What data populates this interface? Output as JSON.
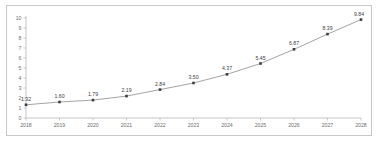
{
  "chart_data": {
    "type": "line",
    "title": "",
    "subtitle": "",
    "xlabel": "",
    "ylabel": "",
    "categories": [
      "2018",
      "2019",
      "2020",
      "2021",
      "2022",
      "2023",
      "2024",
      "2025",
      "2026",
      "2027",
      "2028"
    ],
    "values": [
      1.32,
      1.6,
      1.79,
      2.19,
      2.84,
      3.5,
      4.37,
      5.45,
      6.87,
      8.39,
      9.84
    ],
    "point_labels": [
      "1.32",
      "1.60",
      "1.79",
      "2.19",
      "2.84",
      "3.50",
      "4.37",
      "5.45",
      "6.87",
      "8.39",
      "9.84"
    ],
    "ylim": [
      0,
      10
    ],
    "y_ticks": [
      0,
      1,
      2,
      3,
      4,
      5,
      6,
      7,
      8,
      9,
      10
    ],
    "y_tick_labels": [
      "0",
      "1",
      "2",
      "3",
      "4",
      "5",
      "6",
      "7",
      "8",
      "9",
      "10"
    ],
    "x_tick_labels": [
      "2018",
      "2019",
      "2020",
      "2021",
      "2022",
      "2023",
      "2024",
      "2025",
      "2026",
      "2027",
      "2028"
    ],
    "grid": false,
    "legend": null,
    "legend_position": "none",
    "show_data_labels": true,
    "marker": "square",
    "colors": {
      "line": "#9a9a9a",
      "marker": "#3d3d3d",
      "axis": "#b6b6b6",
      "tick_text": "#6f6f6f",
      "label_text": "#3d3d3d",
      "border": "#c9c9c9",
      "background": "#ffffff"
    }
  }
}
